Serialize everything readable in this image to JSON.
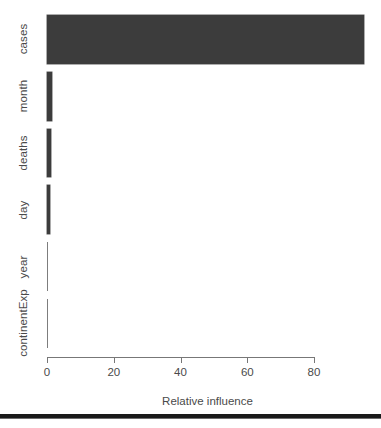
{
  "chart_data": {
    "type": "bar",
    "orientation": "horizontal",
    "title": "",
    "xlabel": "Relative influence",
    "ylabel": "",
    "xlim": [
      0,
      95
    ],
    "xticks": [
      0,
      20,
      40,
      60,
      80
    ],
    "xticklabels": [
      "0",
      "20",
      "40",
      "60",
      "80"
    ],
    "grid": false,
    "legend": null,
    "bar_color": "#3c3c3c",
    "axis_color": "#777777",
    "text_color": "#4a4a4a",
    "categories": [
      "continentExp",
      "year",
      "day",
      "deaths",
      "month",
      "cases"
    ],
    "values": [
      0.0,
      0.0,
      0.9,
      1.2,
      1.5,
      95.0
    ],
    "display_order_top_to_bottom": [
      "cases",
      "month",
      "deaths",
      "day",
      "year",
      "continentExp"
    ],
    "bars": [
      {
        "category": "cases",
        "value": 95.0
      },
      {
        "category": "month",
        "value": 1.5
      },
      {
        "category": "deaths",
        "value": 1.2
      },
      {
        "category": "day",
        "value": 0.9
      },
      {
        "category": "year",
        "value": 0.0
      },
      {
        "category": "continentExp",
        "value": 0.0
      }
    ]
  },
  "axis": {
    "x_title": "Relative influence",
    "tick_labels": [
      "0",
      "20",
      "40",
      "60",
      "80"
    ]
  },
  "category_labels": [
    "cases",
    "month",
    "deaths",
    "day",
    "year",
    "continentExp"
  ]
}
